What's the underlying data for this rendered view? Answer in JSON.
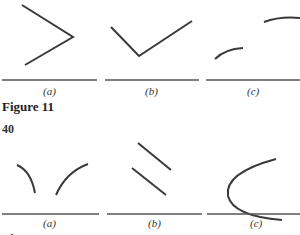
{
  "figure11": {
    "caption": "Figure 11",
    "panels": [
      {
        "label": "(a)",
        "shape": "angle opening left (two line segments meeting at right)"
      },
      {
        "label": "(b)",
        "shape": "V shape (two line segments meeting at bottom)"
      },
      {
        "label": "(c)",
        "shape": "two separated concave-down arcs"
      }
    ]
  },
  "page_number": "40",
  "figure12": {
    "caption": "Figure 12",
    "panels": [
      {
        "label": "(a)",
        "shape": "two arcs approaching a gap near the axis"
      },
      {
        "label": "(b)",
        "shape": "two parallel line segments descending right"
      },
      {
        "label": "(c)",
        "shape": "sideways parabola opening right crossing the axis"
      }
    ]
  },
  "colors": {
    "stroke": "#3a3a3a",
    "axis": "#555555",
    "background": "#ffffff"
  }
}
